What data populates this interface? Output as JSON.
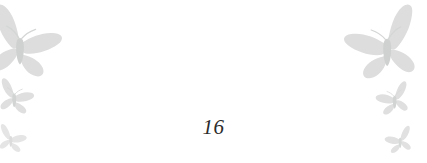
{
  "page": {
    "background_color": "#ffffff",
    "page_number": "16",
    "page_number_color": "#2b2b2b"
  },
  "ornaments": {
    "motif": "butterfly",
    "fill_color": "#dcdddc",
    "fill_color_light": "#e4e5e4",
    "fill_color_dark": "#d2d4d3",
    "left": [
      {
        "name": "butterfly-large-top-left",
        "size": "large"
      },
      {
        "name": "butterfly-medium-left",
        "size": "medium"
      },
      {
        "name": "butterfly-small-bottom-left",
        "size": "small"
      }
    ],
    "right": [
      {
        "name": "butterfly-large-top-right",
        "size": "large"
      },
      {
        "name": "butterfly-medium-right",
        "size": "medium"
      },
      {
        "name": "butterfly-small-bottom-right",
        "size": "small"
      }
    ]
  }
}
